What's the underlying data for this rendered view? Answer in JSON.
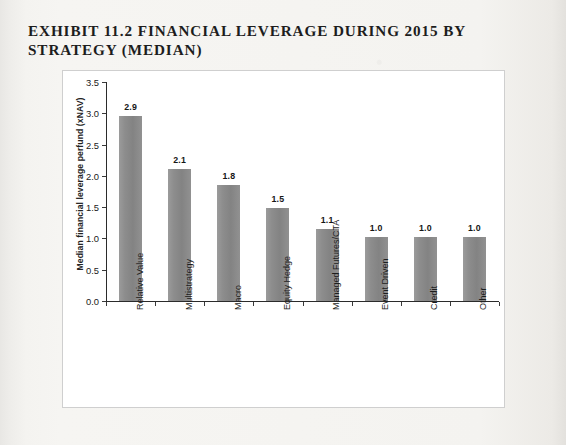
{
  "exhibit": {
    "title_line_1": "EXHIBIT 11.2 FINANCIAL LEVERAGE DURING 2015 BY",
    "title_line_2": "STRATEGY (MEDIAN)"
  },
  "colors": {
    "bar": "#8a8a8a",
    "axis": "#2b2b2b",
    "text": "#1a1a1a",
    "frame_border": "#cfcfcf",
    "page_background": "#f4f3f0",
    "plot_background": "#ffffff"
  },
  "chart_data": {
    "type": "bar",
    "title": "EXHIBIT 11.2 FINANCIAL LEVERAGE DURING 2015 BY STRATEGY (MEDIAN)",
    "xlabel": "",
    "ylabel": "Median financial leverage perfund (xNAV)",
    "categories": [
      "Relative Value",
      "Multistrategy",
      "Macro",
      "Equity Hedge",
      "Managed Futures/CTA",
      "Event Driven",
      "Credit",
      "Other"
    ],
    "values": [
      2.95,
      2.11,
      1.85,
      1.48,
      1.15,
      1.02,
      1.02,
      1.02
    ],
    "data_labels": [
      "2.9",
      "2.1",
      "1.8",
      "1.5",
      "1.1",
      "1.0",
      "1.0",
      "1.0"
    ],
    "ylim": [
      0.0,
      3.5
    ],
    "ytick_labels": [
      "0.0",
      "0.5",
      "1.0",
      "1.5",
      "2.0",
      "2.5",
      "3.0",
      "3.5"
    ],
    "ytick_values": [
      0.0,
      0.5,
      1.0,
      1.5,
      2.0,
      2.5,
      3.0,
      3.5
    ],
    "grid": false,
    "legend": null,
    "legend_position": "none",
    "series_count": 1,
    "bar_color": "#8a8a8a"
  }
}
